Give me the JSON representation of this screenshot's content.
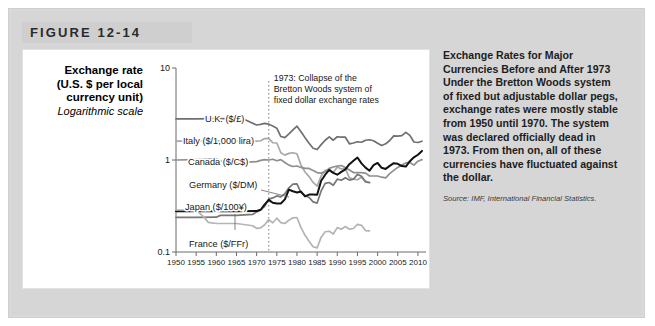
{
  "figure": {
    "label": "FIGURE 12-14"
  },
  "axis_title": {
    "line1": "Exchange rate",
    "line2": "(U.S. $ per local",
    "line3": "currency unit)",
    "line4": "Logarithmic scale"
  },
  "annotation": {
    "line1": "1973: Collapse of the",
    "line2": "Bretton Woods system of",
    "line3": "fixed dollar exchange rates",
    "year": 1973
  },
  "caption": {
    "heading": "Exchange Rates for Major Currencies Before and After 1973",
    "body": "Under the Bretton Woods system of fixed but adjustable dollar pegs, exchange rates were mostly stable from 1950 until 1970. The system was declared officially dead in 1973. From then on, all of these currencies have fluctuated against the dollar.",
    "source": "Source: IMF, International Financial Statistics."
  },
  "colors": {
    "panel_bg": "#d6d6d6",
    "title_bar": "#cfcfcf",
    "card_bg": "#ffffff",
    "uk": "#6f6f6f",
    "italy": "#a8a8a8",
    "canada": "#8f8f8f",
    "germany": "#777777",
    "japan": "#121212",
    "france": "#b4b4b4",
    "axis": "#6b6b6b",
    "annotation_line": "#8a8a8a"
  },
  "chart_data": {
    "type": "line",
    "title": "Exchange Rates for Major Currencies Before and After 1973",
    "xlabel": "",
    "ylabel": "Exchange rate (U.S. $ per local currency unit)",
    "yscale": "log",
    "ylim": [
      0.1,
      10
    ],
    "yticks": [
      10,
      1,
      0.1
    ],
    "ytick_labels": [
      "10",
      "1",
      "0.1"
    ],
    "xlim": [
      1950,
      2012
    ],
    "xticks": [
      1950,
      1955,
      1960,
      1965,
      1970,
      1975,
      1980,
      1985,
      1990,
      1995,
      2000,
      2005,
      2010
    ],
    "xtick_labels": [
      "1950",
      "1955",
      "1960",
      "1965",
      "1970",
      "1975",
      "1980",
      "1985",
      "1990",
      "1995",
      "2000",
      "2005",
      "2010"
    ],
    "grid": false,
    "legend": "inline-labels",
    "annotations": [
      {
        "text": "1973: Collapse of the Bretton Woods system of fixed dollar exchange rates",
        "x": 1973,
        "style": "vertical dotted line"
      }
    ],
    "series": [
      {
        "name": "U.K. ($/£)",
        "label": "U.K. ($/£)",
        "color": "#6f6f6f",
        "x": [
          1950,
          1955,
          1960,
          1965,
          1967,
          1970,
          1971,
          1972,
          1973,
          1974,
          1975,
          1976,
          1977,
          1978,
          1979,
          1980,
          1981,
          1982,
          1983,
          1984,
          1985,
          1986,
          1987,
          1988,
          1989,
          1990,
          1991,
          1992,
          1993,
          1994,
          1995,
          1996,
          1997,
          1998,
          1999,
          2000,
          2001,
          2002,
          2003,
          2004,
          2005,
          2006,
          2007,
          2008,
          2009,
          2010,
          2011
        ],
        "y": [
          2.8,
          2.8,
          2.81,
          2.8,
          2.75,
          2.4,
          2.44,
          2.5,
          2.45,
          2.34,
          2.22,
          1.8,
          1.75,
          1.92,
          2.12,
          2.33,
          2.03,
          1.75,
          1.52,
          1.34,
          1.3,
          1.47,
          1.64,
          1.78,
          1.64,
          1.79,
          1.77,
          1.77,
          1.5,
          1.53,
          1.58,
          1.56,
          1.64,
          1.66,
          1.62,
          1.52,
          1.44,
          1.5,
          1.63,
          1.83,
          1.82,
          1.84,
          2.0,
          1.85,
          1.57,
          1.55,
          1.6
        ]
      },
      {
        "name": "Italy ($/1,000 lira)",
        "label": "Italy ($/1,000 lira)",
        "color": "#a8a8a8",
        "x": [
          1950,
          1955,
          1960,
          1965,
          1970,
          1971,
          1972,
          1973,
          1974,
          1975,
          1976,
          1977,
          1978,
          1979,
          1980,
          1981,
          1982,
          1983,
          1984,
          1985,
          1986,
          1987,
          1988,
          1989,
          1990,
          1991,
          1992,
          1993,
          1994,
          1995,
          1996,
          1997,
          1998
        ],
        "y": [
          1.6,
          1.6,
          1.61,
          1.6,
          1.6,
          1.62,
          1.71,
          1.72,
          1.54,
          1.53,
          1.2,
          1.13,
          1.18,
          1.2,
          1.17,
          0.88,
          0.74,
          0.66,
          0.57,
          0.52,
          0.67,
          0.77,
          0.77,
          0.73,
          0.84,
          0.8,
          0.81,
          0.64,
          0.62,
          0.61,
          0.65,
          0.59,
          0.57
        ]
      },
      {
        "name": "Canada ($/C$)",
        "label": "Canada ($/C$)",
        "color": "#8f8f8f",
        "x": [
          1950,
          1955,
          1960,
          1962,
          1965,
          1970,
          1971,
          1972,
          1973,
          1974,
          1975,
          1976,
          1977,
          1978,
          1979,
          1980,
          1981,
          1982,
          1983,
          1984,
          1985,
          1986,
          1987,
          1988,
          1989,
          1990,
          1991,
          1992,
          1993,
          1994,
          1995,
          1996,
          1997,
          1998,
          1999,
          2000,
          2001,
          2002,
          2003,
          2004,
          2005,
          2006,
          2007,
          2008,
          2009,
          2010,
          2011
        ],
        "y": [
          1.0,
          1.01,
          1.03,
          0.94,
          0.93,
          0.96,
          0.99,
          1.01,
          1.0,
          1.02,
          0.98,
          1.01,
          0.94,
          0.88,
          0.85,
          0.86,
          0.83,
          0.81,
          0.81,
          0.77,
          0.73,
          0.72,
          0.75,
          0.81,
          0.84,
          0.86,
          0.87,
          0.83,
          0.78,
          0.73,
          0.73,
          0.73,
          0.72,
          0.67,
          0.67,
          0.67,
          0.65,
          0.64,
          0.71,
          0.77,
          0.83,
          0.88,
          0.93,
          0.94,
          0.88,
          0.97,
          1.01
        ]
      },
      {
        "name": "Germany ($/DM)",
        "label": "Germany ($/DM)",
        "color": "#777777",
        "x": [
          1950,
          1955,
          1960,
          1961,
          1965,
          1969,
          1970,
          1971,
          1972,
          1973,
          1974,
          1975,
          1976,
          1977,
          1978,
          1979,
          1980,
          1981,
          1982,
          1983,
          1984,
          1985,
          1986,
          1987,
          1988,
          1989,
          1990,
          1991,
          1992,
          1993,
          1994,
          1995,
          1996,
          1997,
          1998
        ],
        "y": [
          0.238,
          0.238,
          0.239,
          0.25,
          0.25,
          0.256,
          0.273,
          0.287,
          0.313,
          0.376,
          0.387,
          0.407,
          0.397,
          0.43,
          0.498,
          0.546,
          0.55,
          0.443,
          0.412,
          0.392,
          0.351,
          0.34,
          0.461,
          0.556,
          0.569,
          0.532,
          0.619,
          0.602,
          0.641,
          0.604,
          0.617,
          0.698,
          0.665,
          0.577,
          0.568
        ]
      },
      {
        "name": "Japan ($/100¥)",
        "label": "Japan ($/100¥)",
        "color": "#121212",
        "x": [
          1950,
          1955,
          1960,
          1965,
          1970,
          1971,
          1972,
          1973,
          1974,
          1975,
          1976,
          1977,
          1978,
          1979,
          1980,
          1981,
          1982,
          1983,
          1984,
          1985,
          1986,
          1987,
          1988,
          1989,
          1990,
          1991,
          1992,
          1993,
          1994,
          1995,
          1996,
          1997,
          1998,
          1999,
          2000,
          2001,
          2002,
          2003,
          2004,
          2005,
          2006,
          2007,
          2008,
          2009,
          2010,
          2011
        ],
        "y": [
          0.278,
          0.278,
          0.278,
          0.278,
          0.279,
          0.288,
          0.33,
          0.369,
          0.343,
          0.337,
          0.337,
          0.373,
          0.477,
          0.457,
          0.443,
          0.454,
          0.402,
          0.421,
          0.421,
          0.42,
          0.594,
          0.692,
          0.78,
          0.725,
          0.692,
          0.743,
          0.79,
          0.9,
          0.979,
          1.064,
          0.92,
          0.826,
          0.765,
          0.878,
          0.928,
          0.823,
          0.8,
          0.863,
          0.924,
          0.908,
          0.86,
          0.849,
          0.97,
          1.069,
          1.14,
          1.255
        ]
      },
      {
        "name": "France ($/FFr)",
        "label": "France ($/FFr)",
        "color": "#b4b4b4",
        "x": [
          1950,
          1955,
          1957,
          1958,
          1960,
          1965,
          1969,
          1970,
          1971,
          1972,
          1973,
          1974,
          1975,
          1976,
          1977,
          1978,
          1979,
          1980,
          1981,
          1982,
          1983,
          1984,
          1985,
          1986,
          1987,
          1988,
          1989,
          1990,
          1991,
          1992,
          1993,
          1994,
          1995,
          1996,
          1997,
          1998
        ],
        "y": [
          0.286,
          0.286,
          0.238,
          0.21,
          0.204,
          0.204,
          0.193,
          0.181,
          0.183,
          0.198,
          0.225,
          0.208,
          0.233,
          0.209,
          0.204,
          0.222,
          0.235,
          0.237,
          0.184,
          0.152,
          0.131,
          0.114,
          0.111,
          0.145,
          0.166,
          0.168,
          0.157,
          0.184,
          0.177,
          0.189,
          0.177,
          0.18,
          0.2,
          0.195,
          0.171,
          0.17
        ]
      }
    ]
  }
}
